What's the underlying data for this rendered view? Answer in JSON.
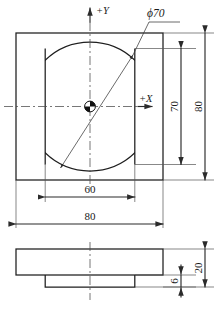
{
  "drawing": {
    "title": "Plate with truncated circular pocket",
    "colors": {
      "background": "#ffffff",
      "outline": "#1e1e1e",
      "dimension": "#3a3a3a",
      "centerline": "#4a4a4a",
      "text": "#1a1a1a"
    },
    "top_view": {
      "name": "top-view",
      "axes": {
        "y_label": "+Y",
        "x_label": "+X"
      },
      "origin_marker": "quadrant-filled-circle",
      "feature_callout": {
        "label": "ϕ70",
        "diameter": 70,
        "symbol": "diameter"
      },
      "dimensions": [
        {
          "name": "width-overall",
          "value": "80",
          "orientation": "horizontal",
          "position": "bottom-outer"
        },
        {
          "name": "flat-width",
          "value": "60",
          "orientation": "horizontal",
          "position": "bottom-inner"
        },
        {
          "name": "height-overall",
          "value": "80",
          "orientation": "vertical",
          "position": "right-outer"
        },
        {
          "name": "pocket-height",
          "value": "70",
          "orientation": "vertical",
          "position": "right-inner"
        }
      ],
      "plate_size": 80,
      "pocket_diameter": 70,
      "pocket_flat_width": 60
    },
    "front_view": {
      "name": "front-view",
      "dimensions": [
        {
          "name": "total-thickness",
          "value": "20",
          "orientation": "vertical",
          "position": "right-outer"
        },
        {
          "name": "boss-thickness",
          "value": "6",
          "orientation": "vertical",
          "position": "right-inner"
        }
      ],
      "total_thickness": 20,
      "boss_thickness": 6
    }
  }
}
